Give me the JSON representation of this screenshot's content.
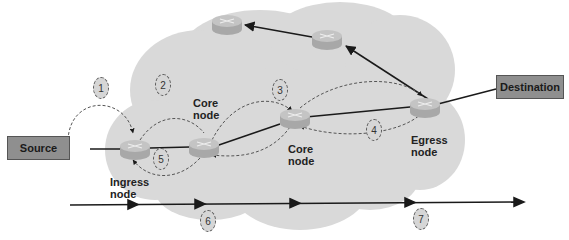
{
  "diagram": {
    "colors": {
      "cloud": "#d9d9d9",
      "router_top": "#c4c4c4",
      "router_side": "#a8a8a8",
      "endpoint_box": "#8f8f8f",
      "line": "#1a1a1a",
      "dashed": "#555555",
      "step_fill": "#d6d6d6"
    },
    "endpoints": {
      "source": "Source",
      "destination": "Destination"
    },
    "node_labels": {
      "ingress_line1": "Ingress",
      "ingress_line2": "node",
      "core1_line1": "Core",
      "core1_line2": "node",
      "core2_line1": "Core",
      "core2_line2": "node",
      "egress_line1": "Egress",
      "egress_line2": "node"
    },
    "steps": [
      "1",
      "2",
      "3",
      "4",
      "5",
      "6",
      "7"
    ],
    "icons": {
      "router": "router-icon",
      "cloud": "network-cloud"
    }
  }
}
